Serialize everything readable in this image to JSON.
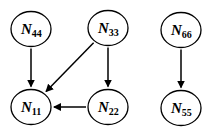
{
  "diagram": {
    "type": "directed-graph",
    "nodes": [
      {
        "id": "N44",
        "letter": "N",
        "sub": "44",
        "cx": 31,
        "cy": 29
      },
      {
        "id": "N33",
        "letter": "N",
        "sub": "33",
        "cx": 108,
        "cy": 28
      },
      {
        "id": "N66",
        "letter": "N",
        "sub": "66",
        "cx": 181,
        "cy": 30
      },
      {
        "id": "N11",
        "letter": "N",
        "sub": "11",
        "cx": 31,
        "cy": 107
      },
      {
        "id": "N22",
        "letter": "N",
        "sub": "22",
        "cx": 108,
        "cy": 107
      },
      {
        "id": "N55",
        "letter": "N",
        "sub": "55",
        "cx": 181,
        "cy": 108
      }
    ],
    "edges": [
      {
        "from": "N44",
        "to": "N11"
      },
      {
        "from": "N33",
        "to": "N11"
      },
      {
        "from": "N33",
        "to": "N22"
      },
      {
        "from": "N22",
        "to": "N11"
      },
      {
        "from": "N66",
        "to": "N55"
      }
    ],
    "colors": {
      "stroke": "#000000",
      "fill": "#ffffff"
    }
  }
}
